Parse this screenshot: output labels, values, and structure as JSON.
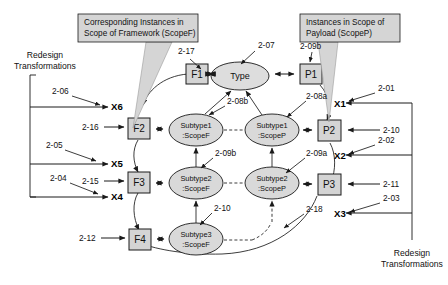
{
  "diagram": {
    "callouts": [
      {
        "id": "callout-scopef",
        "line1": "Corresponding Instances in",
        "line2": "Scope of Framework (ScopeF)"
      },
      {
        "id": "callout-scopep",
        "line1": "Instances in Scope of",
        "line2": "Payload (ScopeP)"
      }
    ],
    "side_labels": {
      "left": {
        "line1": "Redesign",
        "line2": "Transformations"
      },
      "right": {
        "line1": "Redesign",
        "line2": "Transformations"
      }
    },
    "framework_nodes": [
      {
        "id": "F1",
        "label": "F1"
      },
      {
        "id": "F2",
        "label": "F2"
      },
      {
        "id": "F3",
        "label": "F3"
      },
      {
        "id": "F4",
        "label": "F4"
      }
    ],
    "payload_nodes": [
      {
        "id": "P1",
        "label": "P1"
      },
      {
        "id": "P2",
        "label": "P2"
      },
      {
        "id": "P3",
        "label": "P3"
      }
    ],
    "type_node": {
      "label": "Type"
    },
    "scopef_instances": [
      {
        "id": "subtype1-scopef",
        "line1": "Subtype1",
        "line2": ":ScopeF"
      },
      {
        "id": "subtype2-scopef",
        "line1": "Subtype2",
        "line2": ":ScopeF"
      },
      {
        "id": "subtype3-scopef",
        "line1": "Subtype3",
        "line2": ":ScopeF"
      }
    ],
    "scopep_instances": [
      {
        "id": "subtype1-scopep",
        "line1": "Subtype1",
        "line2": ":ScopeP"
      },
      {
        "id": "subtype2-scopep",
        "line1": "Subtype2",
        "line2": ":ScopeP"
      }
    ],
    "x_markers": [
      {
        "id": "X1",
        "label": "X1"
      },
      {
        "id": "X2",
        "label": "X2"
      },
      {
        "id": "X3",
        "label": "X3"
      },
      {
        "id": "X4",
        "label": "X4"
      },
      {
        "id": "X5",
        "label": "X5"
      },
      {
        "id": "X6",
        "label": "X6"
      }
    ],
    "annotations": [
      {
        "id": "a-2-01",
        "label": "2-01"
      },
      {
        "id": "a-2-02",
        "label": "2-02"
      },
      {
        "id": "a-2-03",
        "label": "2-03"
      },
      {
        "id": "a-2-04",
        "label": "2-04"
      },
      {
        "id": "a-2-05",
        "label": "2-05"
      },
      {
        "id": "a-2-06",
        "label": "2-06"
      },
      {
        "id": "a-2-07",
        "label": "2-07"
      },
      {
        "id": "a-2-08a",
        "label": "2-08a"
      },
      {
        "id": "a-2-08b",
        "label": "2-08b"
      },
      {
        "id": "a-2-09a",
        "label": "2-09a"
      },
      {
        "id": "a-2-09b",
        "label": "2-09b"
      },
      {
        "id": "a-2-10",
        "label": "2-10"
      },
      {
        "id": "a-2-11",
        "label": "2-11"
      },
      {
        "id": "a-2-12",
        "label": "2-12"
      },
      {
        "id": "a-2-13",
        "label": "2-13"
      },
      {
        "id": "a-2-14",
        "label": "2-14"
      },
      {
        "id": "a-2-15",
        "label": "2-15"
      },
      {
        "id": "a-2-16",
        "label": "2-16"
      },
      {
        "id": "a-2-17",
        "label": "2-17"
      },
      {
        "id": "a-2-18",
        "label": "2-18"
      }
    ]
  }
}
